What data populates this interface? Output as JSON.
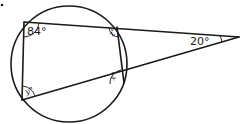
{
  "diagram": {
    "colors": {
      "line": "#1a1a1a",
      "background": "#ffffff"
    },
    "angles": {
      "top_left": "84°",
      "top_right_interior": "z°",
      "bottom_right_interior": "x°",
      "bottom_left": "y°",
      "external_vertex": "20°"
    }
  }
}
